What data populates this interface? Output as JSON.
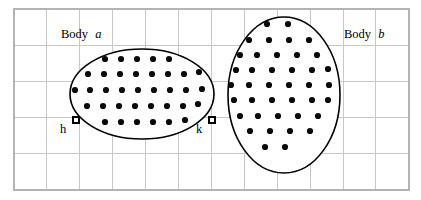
{
  "figure": {
    "title": "",
    "background_color": "#ffffff",
    "width": 421,
    "height": 200
  },
  "grid": {
    "line_color": "#c8c8c8",
    "border_color": "#b4b4b4",
    "x_start": 14,
    "y_start": 9,
    "x_end": 409,
    "y_end": 190,
    "cell_width": 32.9,
    "cell_height": 36.2,
    "columns": 12,
    "rows": 5
  },
  "labels": {
    "body_a_prefix": "Body",
    "body_a_symbol": "a",
    "body_b_prefix": "Body",
    "body_b_symbol": "b",
    "node_h": "h",
    "node_k": "k"
  },
  "bodies": [
    {
      "name": "body-a",
      "label_prefix": "Body",
      "label_symbol": "a",
      "shape": "ellipse",
      "cx": 142,
      "cy": 94,
      "rx": 72,
      "ry": 45,
      "outline_color": "#000000",
      "fill_color": "#ffffff",
      "label_x": 61,
      "label_y": 38,
      "particle_count": 37,
      "particle_color": "#0a0a0a",
      "particle_radius": 3.1
    },
    {
      "name": "body-b",
      "label_prefix": "Body",
      "label_symbol": "b",
      "shape": "ellipse",
      "cx": 284,
      "cy": 95,
      "rx": 56,
      "ry": 78,
      "outline_color": "#000000",
      "fill_color": "#ffffff",
      "label_x": 344,
      "label_y": 38,
      "particle_count": 47,
      "particle_color": "#0a0a0a",
      "particle_radius": 3.1
    }
  ],
  "nodes": [
    {
      "name": "node-h",
      "label": "h",
      "x": 76,
      "y": 120,
      "size": 6,
      "label_x": 63,
      "label_y": 133
    },
    {
      "name": "node-k",
      "label": "k",
      "x": 212,
      "y": 120,
      "size": 6,
      "label_x": 199,
      "label_y": 133
    }
  ],
  "chart_data": {
    "type": "scatter",
    "xlabel": "",
    "ylabel": "",
    "grid": true,
    "legend": "none",
    "series": [
      {
        "name": "Body a",
        "label": "Body a",
        "marker": "filled-circle",
        "color": "#0a0a0a",
        "points": [
          [
            105,
            59
          ],
          [
            121,
            59
          ],
          [
            137,
            59
          ],
          [
            153,
            59
          ],
          [
            169,
            59
          ],
          [
            88,
            74
          ],
          [
            104,
            74
          ],
          [
            120,
            74
          ],
          [
            136,
            74
          ],
          [
            152,
            74
          ],
          [
            168,
            74
          ],
          [
            184,
            74
          ],
          [
            199,
            72
          ],
          [
            75,
            90
          ],
          [
            90,
            90
          ],
          [
            106,
            90
          ],
          [
            122,
            90
          ],
          [
            138,
            90
          ],
          [
            154,
            90
          ],
          [
            170,
            90
          ],
          [
            186,
            90
          ],
          [
            202,
            89
          ],
          [
            87,
            106
          ],
          [
            103,
            106
          ],
          [
            119,
            106
          ],
          [
            135,
            106
          ],
          [
            151,
            106
          ],
          [
            167,
            106
          ],
          [
            183,
            106
          ],
          [
            198,
            104
          ],
          [
            105,
            122
          ],
          [
            121,
            122
          ],
          [
            137,
            122
          ],
          [
            153,
            122
          ],
          [
            169,
            122
          ],
          [
            185,
            120
          ]
        ]
      },
      {
        "name": "Body b",
        "label": "Body b",
        "marker": "filled-circle",
        "color": "#0a0a0a",
        "points": [
          [
            267,
            24
          ],
          [
            288,
            24
          ],
          [
            249,
            40
          ],
          [
            269,
            40
          ],
          [
            289,
            40
          ],
          [
            309,
            40
          ],
          [
            240,
            55
          ],
          [
            257,
            55
          ],
          [
            277,
            55
          ],
          [
            297,
            55
          ],
          [
            317,
            55
          ],
          [
            236,
            70
          ],
          [
            252,
            70
          ],
          [
            272,
            70
          ],
          [
            292,
            70
          ],
          [
            312,
            70
          ],
          [
            328,
            69
          ],
          [
            231,
            85
          ],
          [
            249,
            85
          ],
          [
            269,
            85
          ],
          [
            289,
            85
          ],
          [
            309,
            85
          ],
          [
            329,
            85
          ],
          [
            234,
            100
          ],
          [
            252,
            100
          ],
          [
            272,
            100
          ],
          [
            292,
            100
          ],
          [
            312,
            100
          ],
          [
            328,
            100
          ],
          [
            240,
            116
          ],
          [
            258,
            116
          ],
          [
            278,
            116
          ],
          [
            298,
            116
          ],
          [
            318,
            116
          ],
          [
            250,
            131
          ],
          [
            270,
            131
          ],
          [
            290,
            131
          ],
          [
            310,
            131
          ],
          [
            265,
            147
          ],
          [
            285,
            147
          ]
        ]
      }
    ]
  }
}
